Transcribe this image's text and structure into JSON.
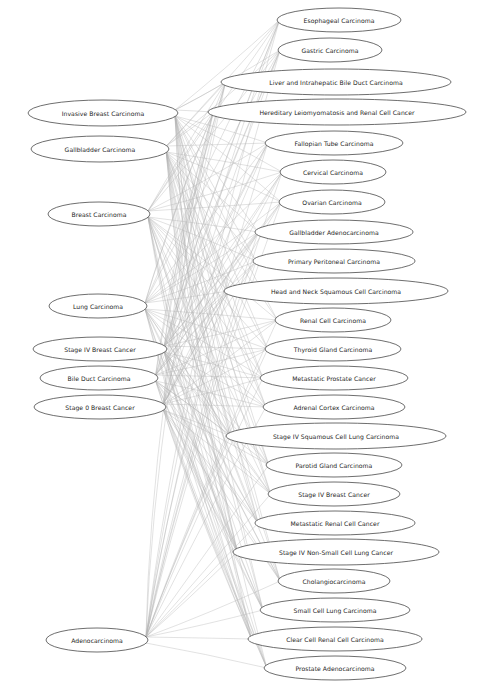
{
  "diagram": {
    "type": "bipartite-graph",
    "title": "",
    "background_color": "#ffffff",
    "node_fill_color": "#ffffff",
    "node_stroke_color": "#3d3d3d",
    "edge_color": "#b4b4b4",
    "label_color": "#1d1d1d",
    "width": 480,
    "height": 697
  },
  "left_nodes": [
    {
      "id": "L0",
      "label": "Invasive Breast Carcinoma",
      "cx": 103,
      "cy": 113,
      "rx": 75,
      "ry": 13
    },
    {
      "id": "L1",
      "label": "Gallbladder Carcinoma",
      "cx": 100,
      "cy": 149,
      "rx": 69,
      "ry": 13
    },
    {
      "id": "L2",
      "label": "Breast Carcinoma",
      "cx": 99,
      "cy": 214,
      "rx": 51,
      "ry": 12
    },
    {
      "id": "L3",
      "label": "Lung Carcinoma",
      "cx": 98,
      "cy": 306,
      "rx": 49,
      "ry": 12
    },
    {
      "id": "L4",
      "label": "Stage IV Breast Cancer",
      "cx": 100,
      "cy": 349,
      "rx": 67,
      "ry": 12
    },
    {
      "id": "L5",
      "label": "Bile Duct Carcinoma",
      "cx": 99,
      "cy": 378,
      "rx": 59,
      "ry": 12
    },
    {
      "id": "L6",
      "label": "Stage 0 Breast Cancer",
      "cx": 100,
      "cy": 407,
      "rx": 66,
      "ry": 12
    },
    {
      "id": "L7",
      "label": "Adenocarcinoma",
      "cx": 97,
      "cy": 640,
      "rx": 51,
      "ry": 12
    }
  ],
  "right_nodes": [
    {
      "id": "R0",
      "label": "Esophageal Carcinoma",
      "cx": 339,
      "cy": 20,
      "rx": 62,
      "ry": 12
    },
    {
      "id": "R1",
      "label": "Gastric Carcinoma",
      "cx": 330,
      "cy": 50,
      "rx": 52,
      "ry": 12
    },
    {
      "id": "R2",
      "label": "Liver and Intrahepatic Bile Duct Carcinoma",
      "cx": 336,
      "cy": 82,
      "rx": 115,
      "ry": 13
    },
    {
      "id": "R3",
      "label": "Hereditary Leiomyomatosis and Renal Cell Cancer",
      "cx": 337,
      "cy": 112,
      "rx": 129,
      "ry": 13
    },
    {
      "id": "R4",
      "label": "Fallopian Tube Carcinoma",
      "cx": 334,
      "cy": 143,
      "rx": 69,
      "ry": 12
    },
    {
      "id": "R5",
      "label": "Cervical Carcinoma",
      "cx": 333,
      "cy": 172,
      "rx": 53,
      "ry": 12
    },
    {
      "id": "R6",
      "label": "Ovarian Carcinoma",
      "cx": 332,
      "cy": 202,
      "rx": 53,
      "ry": 12
    },
    {
      "id": "R7",
      "label": "Gallbladder Adenocarcinoma",
      "cx": 334,
      "cy": 232,
      "rx": 79,
      "ry": 12
    },
    {
      "id": "R8",
      "label": "Primary Peritoneal Carcinoma",
      "cx": 334,
      "cy": 261,
      "rx": 81,
      "ry": 12
    },
    {
      "id": "R9",
      "label": "Head and Neck Squamous Cell Carcinoma",
      "cx": 336,
      "cy": 291,
      "rx": 112,
      "ry": 13
    },
    {
      "id": "R10",
      "label": "Renal Cell Carcinoma",
      "cx": 333,
      "cy": 320,
      "rx": 58,
      "ry": 12
    },
    {
      "id": "R11",
      "label": "Thyroid Gland Carcinoma",
      "cx": 333,
      "cy": 349,
      "rx": 68,
      "ry": 12
    },
    {
      "id": "R12",
      "label": "Metastatic Prostate Cancer",
      "cx": 334,
      "cy": 378,
      "rx": 74,
      "ry": 12
    },
    {
      "id": "R13",
      "label": "Adrenal Cortex Carcinoma",
      "cx": 334,
      "cy": 407,
      "rx": 71,
      "ry": 12
    },
    {
      "id": "R14",
      "label": "Stage IV Squamous Cell Lung Carcinoma",
      "cx": 336,
      "cy": 436,
      "rx": 110,
      "ry": 13
    },
    {
      "id": "R15",
      "label": "Parotid Gland Carcinoma",
      "cx": 334,
      "cy": 465,
      "rx": 68,
      "ry": 12
    },
    {
      "id": "R16",
      "label": "Stage IV Breast Cancer",
      "cx": 334,
      "cy": 494,
      "rx": 66,
      "ry": 12
    },
    {
      "id": "R17",
      "label": "Metastatic Renal Cell Cancer",
      "cx": 335,
      "cy": 523,
      "rx": 80,
      "ry": 12
    },
    {
      "id": "R18",
      "label": "Stage IV Non-Small Cell Lung Cancer",
      "cx": 336,
      "cy": 552,
      "rx": 103,
      "ry": 13
    },
    {
      "id": "R19",
      "label": "Cholangiocarcinoma",
      "cx": 334,
      "cy": 581,
      "rx": 56,
      "ry": 12
    },
    {
      "id": "R20",
      "label": "Small Cell Lung Carcinoma",
      "cx": 335,
      "cy": 610,
      "rx": 75,
      "ry": 12
    },
    {
      "id": "R21",
      "label": "Clear Cell Renal Cell Carcinoma",
      "cx": 335,
      "cy": 639,
      "rx": 87,
      "ry": 12
    },
    {
      "id": "R22",
      "label": "Prostate Adenocarcinoma",
      "cx": 335,
      "cy": 668,
      "rx": 71,
      "ry": 12
    }
  ],
  "edges": [
    {
      "from": "L0",
      "to": "R0"
    },
    {
      "from": "L0",
      "to": "R1"
    },
    {
      "from": "L0",
      "to": "R2"
    },
    {
      "from": "L0",
      "to": "R3"
    },
    {
      "from": "L0",
      "to": "R4"
    },
    {
      "from": "L0",
      "to": "R5"
    },
    {
      "from": "L0",
      "to": "R6"
    },
    {
      "from": "L0",
      "to": "R7"
    },
    {
      "from": "L0",
      "to": "R8"
    },
    {
      "from": "L0",
      "to": "R9"
    },
    {
      "from": "L0",
      "to": "R10"
    },
    {
      "from": "L0",
      "to": "R11"
    },
    {
      "from": "L0",
      "to": "R12"
    },
    {
      "from": "L0",
      "to": "R13"
    },
    {
      "from": "L0",
      "to": "R14"
    },
    {
      "from": "L0",
      "to": "R15"
    },
    {
      "from": "L0",
      "to": "R16"
    },
    {
      "from": "L0",
      "to": "R17"
    },
    {
      "from": "L0",
      "to": "R18"
    },
    {
      "from": "L0",
      "to": "R19"
    },
    {
      "from": "L0",
      "to": "R20"
    },
    {
      "from": "L0",
      "to": "R21"
    },
    {
      "from": "L1",
      "to": "R0"
    },
    {
      "from": "L1",
      "to": "R1"
    },
    {
      "from": "L1",
      "to": "R2"
    },
    {
      "from": "L1",
      "to": "R3"
    },
    {
      "from": "L1",
      "to": "R4"
    },
    {
      "from": "L1",
      "to": "R5"
    },
    {
      "from": "L1",
      "to": "R6"
    },
    {
      "from": "L1",
      "to": "R7"
    },
    {
      "from": "L1",
      "to": "R8"
    },
    {
      "from": "L1",
      "to": "R9"
    },
    {
      "from": "L1",
      "to": "R10"
    },
    {
      "from": "L1",
      "to": "R11"
    },
    {
      "from": "L1",
      "to": "R12"
    },
    {
      "from": "L1",
      "to": "R13"
    },
    {
      "from": "L1",
      "to": "R14"
    },
    {
      "from": "L1",
      "to": "R15"
    },
    {
      "from": "L1",
      "to": "R16"
    },
    {
      "from": "L1",
      "to": "R17"
    },
    {
      "from": "L1",
      "to": "R18"
    },
    {
      "from": "L1",
      "to": "R19"
    },
    {
      "from": "L1",
      "to": "R20"
    },
    {
      "from": "L1",
      "to": "R21"
    },
    {
      "from": "L1",
      "to": "R22"
    },
    {
      "from": "L2",
      "to": "R0"
    },
    {
      "from": "L2",
      "to": "R1"
    },
    {
      "from": "L2",
      "to": "R2"
    },
    {
      "from": "L2",
      "to": "R3"
    },
    {
      "from": "L2",
      "to": "R4"
    },
    {
      "from": "L2",
      "to": "R5"
    },
    {
      "from": "L2",
      "to": "R6"
    },
    {
      "from": "L2",
      "to": "R7"
    },
    {
      "from": "L2",
      "to": "R8"
    },
    {
      "from": "L2",
      "to": "R9"
    },
    {
      "from": "L2",
      "to": "R10"
    },
    {
      "from": "L2",
      "to": "R11"
    },
    {
      "from": "L2",
      "to": "R12"
    },
    {
      "from": "L2",
      "to": "R13"
    },
    {
      "from": "L2",
      "to": "R14"
    },
    {
      "from": "L2",
      "to": "R15"
    },
    {
      "from": "L2",
      "to": "R16"
    },
    {
      "from": "L2",
      "to": "R17"
    },
    {
      "from": "L2",
      "to": "R18"
    },
    {
      "from": "L2",
      "to": "R19"
    },
    {
      "from": "L2",
      "to": "R20"
    },
    {
      "from": "L2",
      "to": "R21"
    },
    {
      "from": "L2",
      "to": "R22"
    },
    {
      "from": "L3",
      "to": "R0"
    },
    {
      "from": "L3",
      "to": "R1"
    },
    {
      "from": "L3",
      "to": "R2"
    },
    {
      "from": "L3",
      "to": "R3"
    },
    {
      "from": "L3",
      "to": "R4"
    },
    {
      "from": "L3",
      "to": "R5"
    },
    {
      "from": "L3",
      "to": "R6"
    },
    {
      "from": "L3",
      "to": "R7"
    },
    {
      "from": "L3",
      "to": "R8"
    },
    {
      "from": "L3",
      "to": "R9"
    },
    {
      "from": "L3",
      "to": "R10"
    },
    {
      "from": "L3",
      "to": "R11"
    },
    {
      "from": "L3",
      "to": "R12"
    },
    {
      "from": "L3",
      "to": "R13"
    },
    {
      "from": "L3",
      "to": "R14"
    },
    {
      "from": "L3",
      "to": "R15"
    },
    {
      "from": "L3",
      "to": "R16"
    },
    {
      "from": "L3",
      "to": "R17"
    },
    {
      "from": "L3",
      "to": "R18"
    },
    {
      "from": "L3",
      "to": "R19"
    },
    {
      "from": "L3",
      "to": "R20"
    },
    {
      "from": "L3",
      "to": "R21"
    },
    {
      "from": "L3",
      "to": "R22"
    },
    {
      "from": "L4",
      "to": "R0"
    },
    {
      "from": "L4",
      "to": "R1"
    },
    {
      "from": "L4",
      "to": "R2"
    },
    {
      "from": "L4",
      "to": "R3"
    },
    {
      "from": "L4",
      "to": "R4"
    },
    {
      "from": "L4",
      "to": "R5"
    },
    {
      "from": "L4",
      "to": "R6"
    },
    {
      "from": "L4",
      "to": "R7"
    },
    {
      "from": "L4",
      "to": "R8"
    },
    {
      "from": "L4",
      "to": "R9"
    },
    {
      "from": "L4",
      "to": "R10"
    },
    {
      "from": "L4",
      "to": "R11"
    },
    {
      "from": "L4",
      "to": "R12"
    },
    {
      "from": "L4",
      "to": "R13"
    },
    {
      "from": "L4",
      "to": "R14"
    },
    {
      "from": "L4",
      "to": "R15"
    },
    {
      "from": "L4",
      "to": "R16"
    },
    {
      "from": "L4",
      "to": "R17"
    },
    {
      "from": "L4",
      "to": "R18"
    },
    {
      "from": "L4",
      "to": "R19"
    },
    {
      "from": "L4",
      "to": "R20"
    },
    {
      "from": "L4",
      "to": "R21"
    },
    {
      "from": "L4",
      "to": "R22"
    },
    {
      "from": "L5",
      "to": "R0"
    },
    {
      "from": "L5",
      "to": "R1"
    },
    {
      "from": "L5",
      "to": "R2"
    },
    {
      "from": "L5",
      "to": "R3"
    },
    {
      "from": "L5",
      "to": "R4"
    },
    {
      "from": "L5",
      "to": "R5"
    },
    {
      "from": "L5",
      "to": "R6"
    },
    {
      "from": "L5",
      "to": "R7"
    },
    {
      "from": "L5",
      "to": "R8"
    },
    {
      "from": "L5",
      "to": "R9"
    },
    {
      "from": "L5",
      "to": "R10"
    },
    {
      "from": "L5",
      "to": "R11"
    },
    {
      "from": "L5",
      "to": "R12"
    },
    {
      "from": "L5",
      "to": "R13"
    },
    {
      "from": "L5",
      "to": "R14"
    },
    {
      "from": "L5",
      "to": "R15"
    },
    {
      "from": "L5",
      "to": "R16"
    },
    {
      "from": "L5",
      "to": "R17"
    },
    {
      "from": "L5",
      "to": "R18"
    },
    {
      "from": "L5",
      "to": "R19"
    },
    {
      "from": "L5",
      "to": "R20"
    },
    {
      "from": "L5",
      "to": "R21"
    },
    {
      "from": "L5",
      "to": "R22"
    },
    {
      "from": "L6",
      "to": "R0"
    },
    {
      "from": "L6",
      "to": "R1"
    },
    {
      "from": "L6",
      "to": "R2"
    },
    {
      "from": "L6",
      "to": "R3"
    },
    {
      "from": "L6",
      "to": "R4"
    },
    {
      "from": "L6",
      "to": "R5"
    },
    {
      "from": "L6",
      "to": "R6"
    },
    {
      "from": "L6",
      "to": "R7"
    },
    {
      "from": "L6",
      "to": "R8"
    },
    {
      "from": "L6",
      "to": "R9"
    },
    {
      "from": "L6",
      "to": "R10"
    },
    {
      "from": "L6",
      "to": "R11"
    },
    {
      "from": "L6",
      "to": "R12"
    },
    {
      "from": "L6",
      "to": "R13"
    },
    {
      "from": "L6",
      "to": "R14"
    },
    {
      "from": "L6",
      "to": "R15"
    },
    {
      "from": "L6",
      "to": "R16"
    },
    {
      "from": "L6",
      "to": "R17"
    },
    {
      "from": "L6",
      "to": "R18"
    },
    {
      "from": "L6",
      "to": "R19"
    },
    {
      "from": "L6",
      "to": "R20"
    },
    {
      "from": "L6",
      "to": "R21"
    },
    {
      "from": "L6",
      "to": "R22"
    },
    {
      "from": "L7",
      "to": "R0"
    },
    {
      "from": "L7",
      "to": "R1"
    },
    {
      "from": "L7",
      "to": "R2"
    },
    {
      "from": "L7",
      "to": "R3"
    },
    {
      "from": "L7",
      "to": "R4"
    },
    {
      "from": "L7",
      "to": "R5"
    },
    {
      "from": "L7",
      "to": "R6"
    },
    {
      "from": "L7",
      "to": "R7"
    },
    {
      "from": "L7",
      "to": "R8"
    },
    {
      "from": "L7",
      "to": "R9"
    },
    {
      "from": "L7",
      "to": "R10"
    },
    {
      "from": "L7",
      "to": "R11"
    },
    {
      "from": "L7",
      "to": "R12"
    },
    {
      "from": "L7",
      "to": "R13"
    },
    {
      "from": "L7",
      "to": "R14"
    },
    {
      "from": "L7",
      "to": "R15"
    },
    {
      "from": "L7",
      "to": "R16"
    },
    {
      "from": "L7",
      "to": "R17"
    },
    {
      "from": "L7",
      "to": "R18"
    },
    {
      "from": "L7",
      "to": "R19"
    },
    {
      "from": "L7",
      "to": "R20"
    },
    {
      "from": "L7",
      "to": "R21"
    },
    {
      "from": "L7",
      "to": "R22"
    }
  ]
}
